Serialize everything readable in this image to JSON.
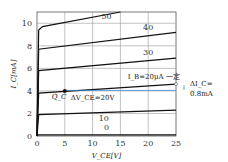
{
  "chart_data": {
    "type": "line",
    "title": "",
    "xlabel": "V_CE[V]",
    "ylabel": "I_C[mA]",
    "xlim": [
      0,
      25
    ],
    "ylim": [
      0,
      11
    ],
    "xticks": [
      0,
      5,
      10,
      15,
      20,
      25
    ],
    "yticks": [
      0,
      2,
      4,
      6,
      8,
      10
    ],
    "grid": true,
    "series": [
      {
        "name": "0",
        "x": [
          0,
          0.3,
          25
        ],
        "y": [
          0,
          0.1,
          0.1
        ]
      },
      {
        "name": "10",
        "x": [
          0,
          0.3,
          25
        ],
        "y": [
          0,
          1.9,
          2.3
        ]
      },
      {
        "name": "20",
        "x": [
          0,
          0.3,
          25
        ],
        "y": [
          0,
          3.8,
          4.6
        ]
      },
      {
        "name": "30",
        "x": [
          0,
          0.3,
          25
        ],
        "y": [
          0,
          5.8,
          6.9
        ]
      },
      {
        "name": "40",
        "x": [
          0,
          0.3,
          25
        ],
        "y": [
          0,
          7.7,
          9.2
        ]
      },
      {
        "name": "50",
        "x": [
          0,
          0.3,
          1,
          15
        ],
        "y": [
          0,
          9.4,
          9.7,
          11
        ]
      }
    ],
    "annotations": {
      "q_point": {
        "label": "Q_C",
        "x": 5,
        "y": 4.0
      },
      "ib_const": "I_B=20μA 一定",
      "delta_vce": "ΔV_CE=20V",
      "delta_ic_line1": "ΔI_C=",
      "delta_ic_line2": "0.8mA"
    }
  }
}
